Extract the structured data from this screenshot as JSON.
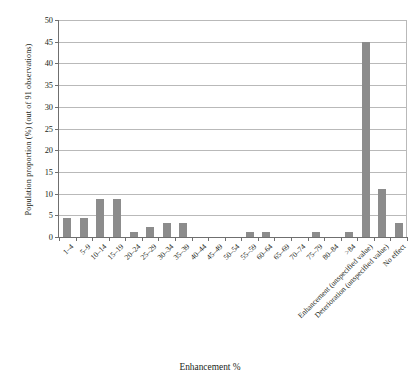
{
  "chart_data": {
    "type": "bar",
    "title": "",
    "subtitle": "",
    "xlabel": "Enhancement %",
    "ylabel": "Population proportion (%) (out of 91 observations)",
    "ylim": [
      0,
      50
    ],
    "ytick_step": 5,
    "yticks": [
      "0",
      "5",
      "10",
      "15",
      "20",
      "25",
      "30",
      "35",
      "40",
      "45",
      "50"
    ],
    "grid": true,
    "legend": "none",
    "bar_color": "#8c8c8c",
    "axis_color": "#6f6f6f",
    "grid_color": "#b9b9b9",
    "categories": [
      "1–4",
      "5–9",
      "10–14",
      "15–19",
      "20–24",
      "25–29",
      "30–34",
      "35–39",
      "40–44",
      "45–49",
      "50–54",
      "55–59",
      "60–64",
      "65–69",
      "70–74",
      "75–79",
      "80–84",
      ">84",
      "Enhancement (unspecified value)",
      "Deterioration (unspecified value)",
      "No effect"
    ],
    "values": [
      4.4,
      4.4,
      8.8,
      8.8,
      1.1,
      2.2,
      3.3,
      3.3,
      0,
      0,
      0,
      1.1,
      1.1,
      0,
      0,
      1.1,
      0,
      1.1,
      45,
      11,
      3.3
    ]
  }
}
